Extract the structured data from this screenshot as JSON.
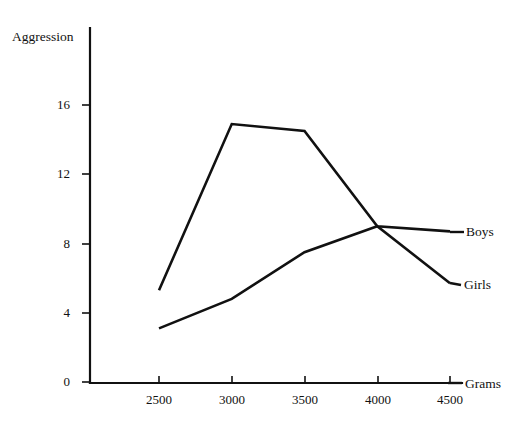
{
  "chart_data": {
    "type": "line",
    "title": "",
    "xlabel": "Grams",
    "ylabel": "Aggression",
    "x": [
      2500,
      3000,
      3500,
      4000,
      4500
    ],
    "xtick_labels": [
      "2500",
      "3000",
      "3500",
      "4000",
      "4500"
    ],
    "ytick_labels": [
      "0",
      "4",
      "8",
      "12",
      "16"
    ],
    "ytick_values": [
      0,
      4,
      8,
      12,
      16
    ],
    "xlim": [
      2300,
      4600
    ],
    "ylim": [
      0,
      20.5
    ],
    "grid": false,
    "legend_position": "inline-right-end-labels",
    "series": [
      {
        "name": "Boys",
        "values": [
          5.3,
          14.9,
          14.5,
          9.0,
          8.7
        ]
      },
      {
        "name": "Girls",
        "values": [
          3.1,
          4.8,
          7.5,
          9.0,
          5.7
        ]
      }
    ]
  },
  "axes": {
    "y_title": "Aggression",
    "x_title": "Grams"
  },
  "series_labels": {
    "boys": "Boys",
    "girls": "Girls"
  },
  "ticks": {
    "y": [
      "0",
      "4",
      "8",
      "12",
      "16"
    ],
    "x": [
      "2500",
      "3000",
      "3500",
      "4000",
      "4500"
    ]
  },
  "colors": {
    "line": "#111111",
    "axis": "#111111",
    "background": "#ffffff"
  }
}
